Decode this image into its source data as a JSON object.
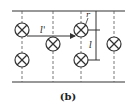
{
  "figure": {
    "caption": "(b)",
    "labels": {
      "l_prime": "l'",
      "r": "r",
      "l": "l"
    },
    "colors": {
      "stroke": "#333333",
      "background": "#ffffff"
    },
    "conductors": [
      {
        "x": 22,
        "y": 30,
        "symbol": "into-page"
      },
      {
        "x": 53,
        "y": 44,
        "symbol": "into-page"
      },
      {
        "x": 22,
        "y": 60,
        "symbol": "into-page"
      },
      {
        "x": 81,
        "y": 30,
        "symbol": "into-page"
      },
      {
        "x": 81,
        "y": 60,
        "symbol": "into-page"
      },
      {
        "x": 114,
        "y": 44,
        "symbol": "into-page"
      }
    ]
  }
}
